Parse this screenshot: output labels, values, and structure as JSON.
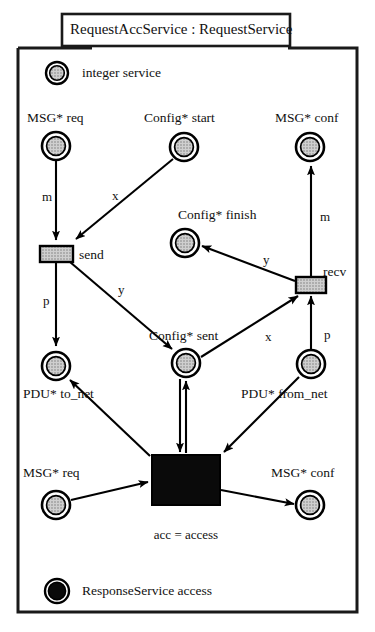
{
  "diagram": {
    "type": "hierarchical-coloured-petri-net",
    "title": "RequestAccService : RequestService",
    "page_caption": "acc = access",
    "colors": {
      "ink": "#000000",
      "place_fill": "#b8b8b8",
      "transition_fill": "#b8b8b8",
      "substitution_fill": "#000000",
      "background": "#ffffff"
    }
  },
  "legend": {
    "items": [
      {
        "name": "service",
        "colour_set": "integer",
        "label": "integer  service",
        "marking": "token",
        "style": "double-circle-shaded"
      },
      {
        "name": "access",
        "colour_set": "ResponseService",
        "label": "ResponseService access",
        "marking": "token",
        "style": "double-circle-filled"
      }
    ]
  },
  "places": [
    {
      "id": "req_top",
      "colour_set": "MSG*",
      "name": "req",
      "label": "MSG*  req",
      "x": 56,
      "y": 146,
      "r": 14
    },
    {
      "id": "start",
      "colour_set": "Config*",
      "name": "start",
      "label": "Config*  start",
      "x": 184,
      "y": 147,
      "r": 14
    },
    {
      "id": "conf_top",
      "colour_set": "MSG*",
      "name": "conf",
      "label": "MSG*  conf",
      "x": 310,
      "y": 147,
      "r": 14
    },
    {
      "id": "finish",
      "colour_set": "Config*",
      "name": "finish",
      "label": "Config*  finish",
      "x": 185,
      "y": 243,
      "r": 14
    },
    {
      "id": "sent",
      "colour_set": "Config*",
      "name": "sent",
      "label": "Config*  sent",
      "x": 186,
      "y": 363,
      "r": 14
    },
    {
      "id": "to_net",
      "colour_set": "PDU*",
      "name": "to_net",
      "label": "PDU*  to_net",
      "x": 56,
      "y": 366,
      "r": 14
    },
    {
      "id": "from_net",
      "colour_set": "PDU*",
      "name": "from_net",
      "label": "PDU*  from_net",
      "x": 311,
      "y": 364,
      "r": 14
    },
    {
      "id": "req_bottom",
      "colour_set": "MSG*",
      "name": "req",
      "label": "MSG*  req",
      "x": 56,
      "y": 505,
      "r": 14
    },
    {
      "id": "conf_bottom",
      "colour_set": "MSG*",
      "name": "conf",
      "label": "MSG*  conf",
      "x": 310,
      "y": 505,
      "r": 14
    }
  ],
  "transitions": [
    {
      "id": "send",
      "label": "send",
      "kind": "normal",
      "x": 40,
      "y": 246,
      "w": 33,
      "h": 16
    },
    {
      "id": "recv",
      "label": "recv",
      "kind": "normal",
      "x": 296,
      "y": 277,
      "w": 30,
      "h": 16
    },
    {
      "id": "acc",
      "label": "",
      "kind": "substitution",
      "x": 152,
      "y": 455,
      "w": 68,
      "h": 50
    }
  ],
  "arcs": [
    {
      "from": "req_top",
      "to": "send",
      "inscription": "m"
    },
    {
      "from": "start",
      "to": "send",
      "inscription": "x"
    },
    {
      "from": "send",
      "to": "to_net",
      "inscription": "p"
    },
    {
      "from": "send",
      "to": "sent",
      "inscription": "y"
    },
    {
      "from": "sent",
      "to": "recv",
      "inscription": "x"
    },
    {
      "from": "from_net",
      "to": "recv",
      "inscription": "p"
    },
    {
      "from": "recv",
      "to": "finish",
      "inscription": "y"
    },
    {
      "from": "recv",
      "to": "conf_top",
      "inscription": "m"
    },
    {
      "from": "acc",
      "to": "to_net",
      "inscription": ""
    },
    {
      "from": "acc",
      "to": "sent",
      "inscription": ""
    },
    {
      "from": "sent",
      "to": "acc",
      "inscription": ""
    },
    {
      "from": "from_net",
      "to": "acc",
      "inscription": ""
    },
    {
      "from": "req_bottom",
      "to": "acc",
      "inscription": ""
    },
    {
      "from": "acc",
      "to": "conf_bottom",
      "inscription": ""
    }
  ],
  "arc_labels": {
    "m_left": "m",
    "x_start": "x",
    "p_left": "p",
    "y_send": "y",
    "x_sent": "x",
    "p_right": "p",
    "y_recv": "y",
    "m_right": "m"
  },
  "node_labels": {
    "req_top": "MSG*  req",
    "start": "Config*  start",
    "conf_top": "MSG*  conf",
    "finish": "Config*  finish",
    "sent": "Config*  sent",
    "to_net": "PDU*  to_net",
    "from_net": "PDU*  from_net",
    "req_bottom": "MSG*  req",
    "conf_bottom": "MSG*  conf"
  },
  "transition_labels": {
    "send": "send",
    "recv": "recv"
  }
}
